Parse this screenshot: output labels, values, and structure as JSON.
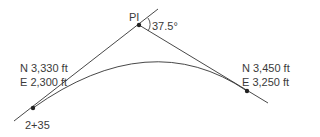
{
  "diagram": {
    "type": "horizontal curve",
    "pi_label": "PI",
    "deflection_angle": "37.5°",
    "start_point": {
      "station": "2+35",
      "northing": "N 3,330 ft",
      "easting": "E 2,300 ft"
    },
    "end_point": {
      "northing": "N 3,450 ft",
      "easting": "E 3,250 ft"
    },
    "colors": {
      "line": "#333333",
      "text": "#3a3a3a",
      "background": "#ffffff"
    }
  }
}
